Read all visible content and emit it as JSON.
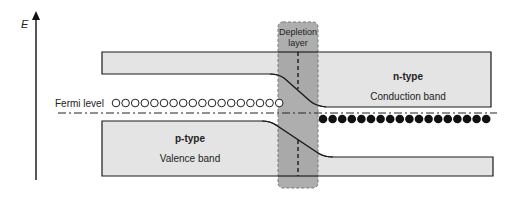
{
  "axis": {
    "label": "E"
  },
  "fermi_level": {
    "label": "Fermi level"
  },
  "depletion_layer": {
    "line1": "Depletion",
    "line2": "layer"
  },
  "n_region": {
    "type_label": "n-type",
    "band_label": "Conduction band"
  },
  "p_region": {
    "type_label": "p-type",
    "band_label": "Valence band"
  },
  "carriers": {
    "holes_count": 18,
    "electrons_count": 18,
    "holes_symbol": "open-circle",
    "electrons_symbol": "filled-circle"
  },
  "colors": {
    "band_fill": "#e4e4e4",
    "band_stroke": "#1a1a1a",
    "depletion_fill": "#9a9a9a",
    "axis": "#111111"
  }
}
